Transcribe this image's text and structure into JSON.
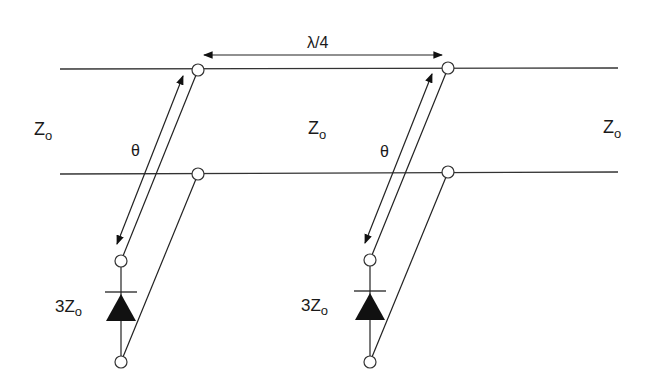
{
  "diagram": {
    "type": "transmission-line circuit",
    "colors": {
      "line": "#333333",
      "fill": "#111111",
      "background": "#ffffff"
    },
    "labels": {
      "spacing": "λ/4",
      "z_left": {
        "main": "Z",
        "sub": "o"
      },
      "z_center": {
        "main": "Z",
        "sub": "o"
      },
      "z_right": {
        "main": "Z",
        "sub": "o"
      },
      "stub_left_angle": "θ",
      "stub_right_angle": "θ",
      "stub_left_impedance": {
        "prefix": "3Z",
        "sub": "o"
      },
      "stub_right_impedance": {
        "prefix": "3Z",
        "sub": "o"
      }
    },
    "components": [
      {
        "id": "stub-left",
        "element": "diode",
        "impedance": "3Zo",
        "electrical_length": "θ"
      },
      {
        "id": "stub-right",
        "element": "diode",
        "impedance": "3Zo",
        "electrical_length": "θ"
      }
    ]
  }
}
